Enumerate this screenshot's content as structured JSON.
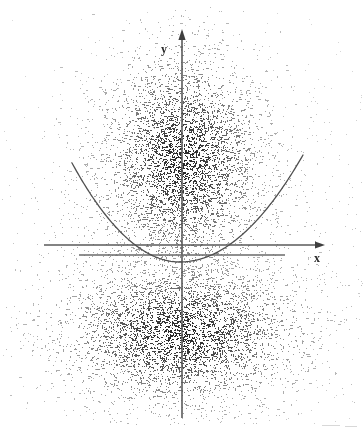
{
  "figure": {
    "width": 364,
    "height": 430,
    "background_color": "#ffffff",
    "ink_color": "#3a3a3a",
    "axis_color": "#555555",
    "curve_color": "#4a4a4a",
    "appearance": "scanned-photocopy-grayscale"
  },
  "labels": {
    "y_axis": "y",
    "x_axis": "x"
  },
  "chart_data": {
    "type": "scatter",
    "title": "",
    "subtitle": "",
    "xlabel": "x",
    "ylabel": "y",
    "grid": false,
    "legend": null,
    "axis_ranges": {
      "x_pixels": [
        44,
        325
      ],
      "y_pixels": [
        29,
        418
      ]
    },
    "origin_pixels": {
      "x": 182,
      "y": 245
    },
    "axes": [
      {
        "name": "y-axis",
        "orientation": "vertical",
        "x": 182,
        "y_start": 29,
        "y_end": 418,
        "arrow_at": "top",
        "label": "y",
        "label_position": {
          "x": 166,
          "y": 50
        }
      },
      {
        "name": "x-axis",
        "orientation": "horizontal",
        "y": 245,
        "x_start": 44,
        "x_end": 325,
        "arrow_at": "right",
        "label": "x",
        "label_position": {
          "x": 318,
          "y": 259
        }
      }
    ],
    "reference_lines": [
      {
        "name": "secondary-horizontal-line",
        "orientation": "horizontal",
        "y": 255,
        "x_start": 79,
        "x_end": 285,
        "arrow_at": "none",
        "style": "solid"
      }
    ],
    "curves": [
      {
        "name": "parabola",
        "shape": "upward-opening-parabola",
        "vertex_pixels": {
          "x": 180,
          "y": 262
        },
        "left_endpoint_pixels": {
          "x": 72,
          "y": 163
        },
        "right_endpoint_pixels": {
          "x": 303,
          "y": 155
        },
        "style": "solid",
        "description": "quadratic curve passing near the origin with vertex just below the x-axis"
      }
    ],
    "point_clouds": [
      {
        "name": "upper-cloud",
        "region": "above x-axis",
        "center_pixels": {
          "x": 182,
          "y": 160
        },
        "spread_x": 42,
        "spread_y": 56,
        "n_points": 4200,
        "shape": "tall narrow vertical blob concentrated along the y-axis",
        "density": "high"
      },
      {
        "name": "lower-cloud",
        "region": "below x-axis",
        "center_pixels": {
          "x": 180,
          "y": 333
        },
        "spread_x": 62,
        "spread_y": 38,
        "n_points": 4200,
        "shape": "wide flattened horizontal blob straddling the y-axis",
        "density": "high"
      },
      {
        "name": "sparse-halo",
        "region": "surrounding both clouds",
        "center_pixels": {
          "x": 182,
          "y": 250
        },
        "spread_x": 105,
        "spread_y": 120,
        "n_points": 1500,
        "shape": "faint diffuse speckle scatter",
        "density": "low"
      }
    ]
  },
  "artifacts": [
    {
      "name": "bottom-right-scan-mark",
      "x": 322,
      "y": 425,
      "width": 18,
      "height": 1
    },
    {
      "name": "bottom-right-scan-mark-2",
      "x": 345,
      "y": 426,
      "width": 12,
      "height": 1
    }
  ]
}
